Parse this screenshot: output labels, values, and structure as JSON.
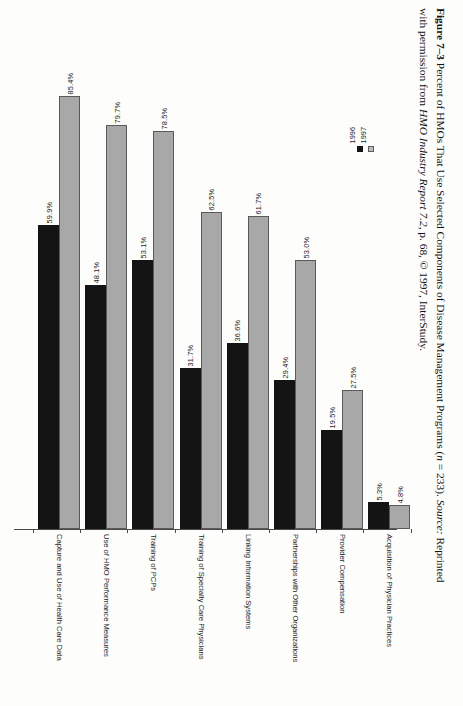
{
  "caption": {
    "label": "Figure 7–3",
    "line1_rest": " Percent of HMOs That Use Selected Components of Disease Management Programs (",
    "n_italic": "n",
    "n_value": " = 233). ",
    "source_italic": "Source:",
    "line1_tail": " Reprinted",
    "line2_start": "with permission from ",
    "line2_italic": "HMO Industry Report 7.2",
    "line2_tail": ", p. 68, © 1997, InterStudy."
  },
  "legend": {
    "position": "right-upper",
    "items": [
      {
        "label": "1996",
        "color": "#141414",
        "swatch": "black-square-icon"
      },
      {
        "label": "1997",
        "color": "#bdbdbd",
        "swatch": "gray-square-icon"
      }
    ]
  },
  "chart_data": {
    "type": "bar",
    "title": "Percent of HMOs That Use Selected Components of Disease Management Programs",
    "xlabel": "",
    "ylabel": "",
    "ylim": [
      0,
      100
    ],
    "grid": false,
    "orientation": "vertical-bars-on-rotated-page",
    "value_suffix": "%",
    "legend_position": "right",
    "n": 233,
    "categories": [
      "Capture and Use of Health Care Data",
      "Use of HMO Performance Measures",
      "Training of PCPs",
      "Training of Specialty Care Physicians",
      "Linking Information Systems",
      "Partnerships with Other Organizations",
      "Provider Compensation",
      "Acquisition of Physician Practices"
    ],
    "series": [
      {
        "name": "1996",
        "color": "#141414",
        "values": [
          59.9,
          48.1,
          53.1,
          31.7,
          36.6,
          29.4,
          19.5,
          5.3
        ],
        "labels": [
          "59.9%",
          "48.1%",
          "53.1%",
          "31.7%",
          "36.6%",
          "29.4%",
          "19.5%",
          "5.3%"
        ]
      },
      {
        "name": "1997",
        "color": "#a8a8a8",
        "values": [
          85.4,
          79.7,
          78.5,
          62.5,
          61.7,
          53.0,
          27.5,
          4.8
        ],
        "labels": [
          "85.4%",
          "79.7%",
          "78.5%",
          "62.5%",
          "61.7%",
          "53.0%",
          "27.5%",
          "4.8%"
        ]
      }
    ]
  }
}
